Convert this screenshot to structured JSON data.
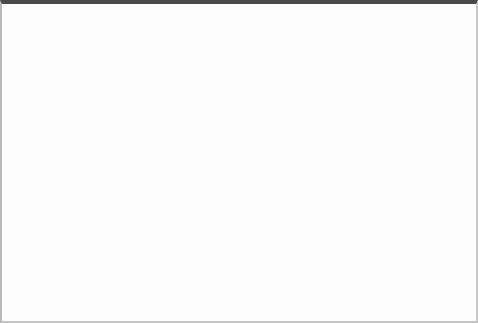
{
  "figure": {
    "kind": "tree-with-nested-regions-diagram",
    "width": 478,
    "height": 323,
    "background_color": "#ffffff",
    "frame_top_color": "#4a4a4a",
    "frame_side_color": "#c4c4c4"
  },
  "palette": {
    "blob_fill": "#ededed",
    "region_outer_fill": "#dcdcdc",
    "region_middle_fill": "#bdbdbd",
    "region_inner_fill": "#fbfbfb",
    "edge_color": "#6d6d6d",
    "label_color": "#2b2b2b",
    "highlight_path_color": "#a9a9a9",
    "arrow_color": "#5c5c5c"
  },
  "regions": [
    {
      "id": "blob",
      "name": "outer-blob",
      "shape": "rounded-triangle",
      "fill": "#ededed",
      "apex": [
        240,
        24
      ],
      "left_base": [
        62,
        288
      ],
      "right_base": [
        400,
        288
      ]
    },
    {
      "id": "region-outer",
      "name": "outer-circle-region",
      "shape": "circle",
      "fill": "#dcdcdc",
      "cx": 286,
      "cy": 190,
      "r": 86
    },
    {
      "id": "region-middle",
      "name": "middle-circle-region",
      "shape": "circle",
      "fill": "#bdbdbd",
      "cx": 262,
      "cy": 200,
      "r": 58
    },
    {
      "id": "region-inner",
      "name": "inner-circle-region",
      "shape": "circle",
      "fill": "#fbfbfb",
      "cx": 288,
      "cy": 221,
      "r": 17
    }
  ],
  "nodes": [
    {
      "id": "A",
      "label": "A",
      "x": 94,
      "y": 218,
      "depth": 3
    },
    {
      "id": "B",
      "label": "B",
      "x": 137,
      "y": 183,
      "depth": 2
    },
    {
      "id": "C",
      "label": "C",
      "x": 178,
      "y": 218,
      "depth": 3
    },
    {
      "id": "D",
      "label": "D",
      "x": 183,
      "y": 147,
      "depth": 1
    },
    {
      "id": "E",
      "label": "E",
      "x": 211,
      "y": 187,
      "depth": 2
    },
    {
      "id": "G",
      "label": "G",
      "x": 245,
      "y": 101,
      "depth": 0
    },
    {
      "id": "H",
      "label": "H",
      "x": 235,
      "y": 218,
      "depth": 3
    },
    {
      "id": "I",
      "label": "I",
      "x": 262,
      "y": 181,
      "depth": 2
    },
    {
      "id": "J",
      "label": "J",
      "x": 288,
      "y": 221,
      "depth": 3
    },
    {
      "id": "K",
      "label": "K",
      "x": 302,
      "y": 147,
      "depth": 1
    },
    {
      "id": "L",
      "label": "L",
      "x": 320,
      "y": 218,
      "depth": 3
    },
    {
      "id": "M",
      "label": "M",
      "x": 352,
      "y": 182,
      "depth": 2
    }
  ],
  "edges": [
    {
      "from": "G",
      "to": "D"
    },
    {
      "from": "G",
      "to": "K"
    },
    {
      "from": "D",
      "to": "B"
    },
    {
      "from": "D",
      "to": "E"
    },
    {
      "from": "B",
      "to": "A"
    },
    {
      "from": "B",
      "to": "C"
    },
    {
      "from": "K",
      "to": "I"
    },
    {
      "from": "K",
      "to": "M"
    },
    {
      "from": "I",
      "to": "H"
    },
    {
      "from": "I",
      "to": "J"
    },
    {
      "from": "M",
      "to": "L"
    }
  ],
  "highlight_path": {
    "name": "search-traversal-path",
    "sequence": [
      "G",
      "K",
      "I",
      "J"
    ],
    "style": "dotted",
    "color": "#a9a9a9",
    "has_arrowhead": true,
    "arrow_target": "J"
  },
  "arrow": {
    "name": "pointer-arrow-to-J",
    "from": [
      262,
      188
    ],
    "to": [
      284,
      212
    ],
    "color": "#5c5c5c"
  }
}
